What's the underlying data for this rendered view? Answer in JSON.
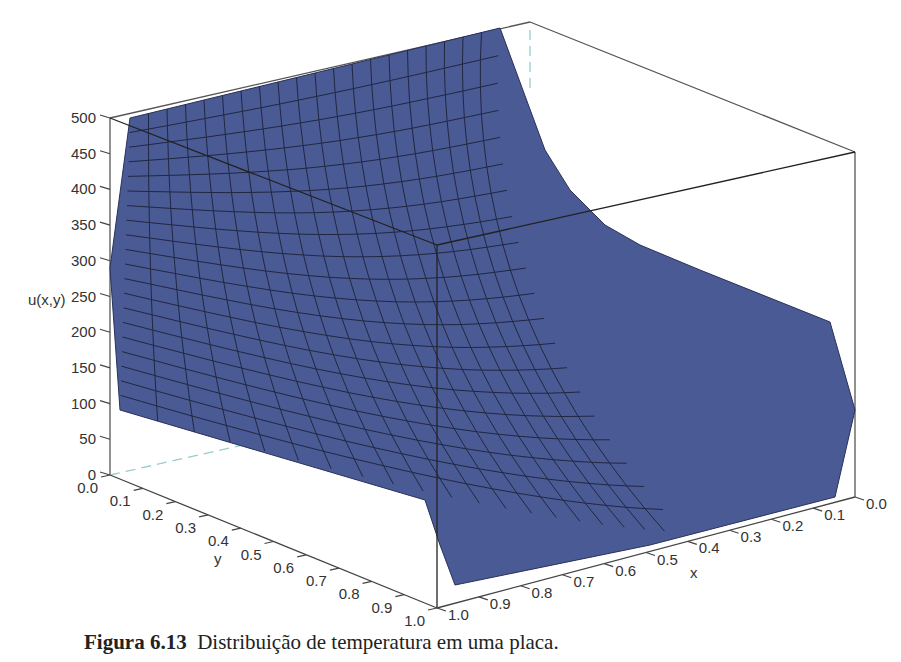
{
  "caption": {
    "label": "Figura 6.13",
    "text": "Distribuição de temperatura em uma placa."
  },
  "chart_data": {
    "type": "surface3d",
    "title": "",
    "zlabel": "u(x,y)",
    "xlabel": "x",
    "ylabel": "y",
    "zlim": [
      0,
      500
    ],
    "xlim": [
      0,
      1
    ],
    "ylim": [
      0,
      1
    ],
    "z_ticks": [
      0,
      50,
      100,
      150,
      200,
      250,
      300,
      350,
      400,
      450,
      500
    ],
    "x_ticks": [
      "1.0",
      "0.9",
      "0.8",
      "0.7",
      "0.6",
      "0.5",
      "0.4",
      "0.3",
      "0.2",
      "0.1",
      "0.0"
    ],
    "y_ticks": [
      "0.0",
      "0.1",
      "0.2",
      "0.3",
      "0.4",
      "0.5",
      "0.6",
      "0.7",
      "0.8",
      "0.9",
      "1.0"
    ],
    "surface_color": "#4a5a94",
    "mesh_color": "#1a1f33",
    "grid_resolution": 20,
    "boundary_conditions": {
      "edge_high": "u = 500 along one edge (back edge of plate)",
      "other_edges": "u = 0"
    }
  }
}
